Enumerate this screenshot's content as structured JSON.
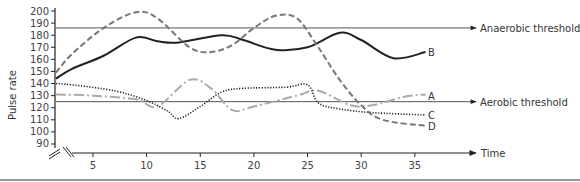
{
  "chart_data": {
    "type": "line",
    "title": "",
    "xlabel": "Time",
    "ylabel": "Pulse rate",
    "xlim": [
      0,
      37
    ],
    "ylim": [
      90,
      200
    ],
    "x_ticks": [
      5,
      10,
      15,
      20,
      25,
      30,
      35
    ],
    "y_ticks": [
      90,
      100,
      110,
      120,
      130,
      140,
      150,
      160,
      170,
      180,
      190,
      200
    ],
    "grid": false,
    "axis_breaks": true,
    "reference_lines": [
      {
        "name": "Anaerobic threshold",
        "y": 186
      },
      {
        "name": "Aerobic threshold",
        "y": 125
      }
    ],
    "series": [
      {
        "name": "A",
        "style": "dash-dot, light gray",
        "x": [
          0,
          5,
          9,
          11,
          14,
          16,
          18,
          20,
          24,
          26,
          29,
          31,
          34,
          36
        ],
        "y": [
          131,
          130,
          127,
          121,
          143,
          136,
          118,
          121,
          130,
          134,
          122,
          122,
          129,
          131
        ]
      },
      {
        "name": "B",
        "style": "solid, dark",
        "x": [
          0,
          3,
          6,
          9,
          11,
          13,
          17,
          19,
          22,
          25,
          28,
          30,
          33,
          36
        ],
        "y": [
          144,
          152,
          163,
          178,
          175,
          174,
          180,
          176,
          168,
          170,
          182,
          176,
          161,
          166
        ]
      },
      {
        "name": "C",
        "style": "dotted, dark",
        "x": [
          0,
          3,
          7,
          10,
          12,
          13,
          15,
          17,
          19,
          23,
          25,
          26,
          28,
          31,
          36
        ],
        "y": [
          140,
          139,
          134,
          126,
          117,
          111,
          121,
          133,
          136,
          137,
          139,
          124,
          119,
          116,
          114
        ]
      },
      {
        "name": "D",
        "style": "dashed, gray",
        "x": [
          0,
          3,
          6,
          9,
          11,
          14,
          16,
          18,
          20,
          22,
          24,
          26,
          28,
          30,
          32,
          36
        ],
        "y": [
          149,
          164,
          186,
          199,
          194,
          170,
          166,
          172,
          186,
          196,
          194,
          170,
          143,
          122,
          110,
          105
        ]
      }
    ]
  },
  "labels": {
    "ylabel": "Pulse rate",
    "xlabel": "Time",
    "anaerobic": "Anaerobic threshold",
    "aerobic": "Aerobic threshold",
    "A": "A",
    "B": "B",
    "C": "C",
    "D": "D"
  }
}
